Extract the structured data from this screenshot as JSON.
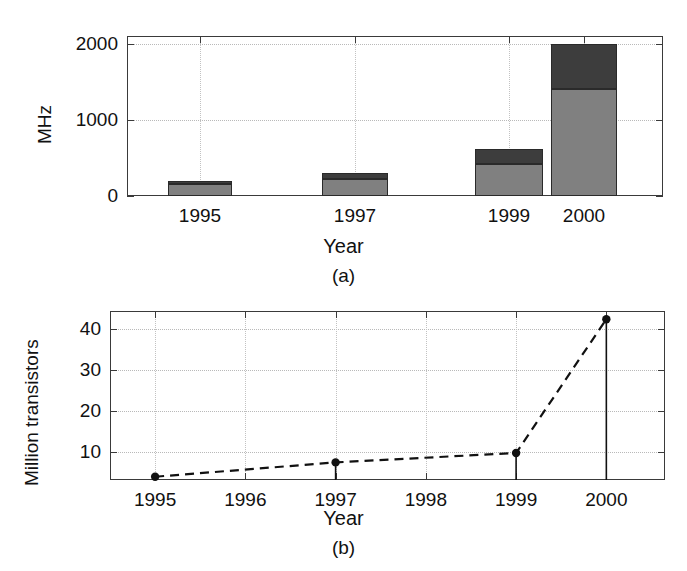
{
  "figure": {
    "panels": [
      {
        "caption": "(a)"
      },
      {
        "caption": "(b)"
      }
    ]
  },
  "colors": {
    "bar_light": "#808080",
    "bar_dark": "#3d3d3d",
    "axis": "#3a3a3a",
    "grid": "#bcbcbc",
    "text": "#111111",
    "marker": "#111111"
  },
  "chart_data": [
    {
      "id": "panel-a",
      "type": "bar",
      "stacked": true,
      "title": "",
      "xlabel": "Year",
      "ylabel": "MHz",
      "caption": "(a)",
      "categories": [
        "1995",
        "1997",
        "1999",
        "2000"
      ],
      "ylim": [
        0,
        2100
      ],
      "yticks": [
        0,
        1000,
        2000
      ],
      "ytick_labels": [
        "0",
        "1000",
        "2000"
      ],
      "grid": true,
      "legend": "none",
      "series": [
        {
          "name": "lower",
          "color": "#808080",
          "values": [
            160,
            225,
            425,
            1400
          ]
        },
        {
          "name": "upper",
          "color": "#3d3d3d",
          "values": [
            40,
            75,
            190,
            600
          ]
        }
      ],
      "totals": [
        200,
        300,
        615,
        2000
      ]
    },
    {
      "id": "panel-b",
      "type": "line",
      "title": "",
      "xlabel": "Year",
      "ylabel": "Million transistors",
      "caption": "(b)",
      "xlim": [
        1994.5,
        2000.65
      ],
      "xticks": [
        1995,
        1996,
        1997,
        1998,
        1999,
        2000
      ],
      "xtick_labels": [
        "1995",
        "1996",
        "1997",
        "1998",
        "1999",
        "2000"
      ],
      "ylim": [
        3.2,
        44.5
      ],
      "yticks": [
        10,
        20,
        30,
        40
      ],
      "ytick_labels": [
        "10",
        "20",
        "30",
        "40"
      ],
      "grid": true,
      "linestyle": "dashed",
      "marker": "filled-circle",
      "stems": true,
      "legend": "none",
      "x": [
        1995,
        1997,
        1999,
        2000
      ],
      "values": [
        4.0,
        7.5,
        9.8,
        42.5
      ]
    }
  ]
}
